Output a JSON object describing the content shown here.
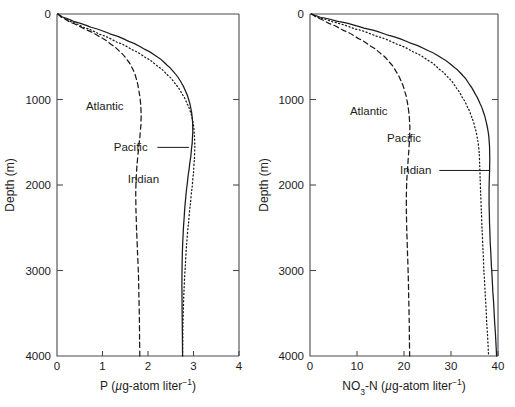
{
  "figure": {
    "background_color": "#ffffff",
    "curve_color": "#1a1a1a",
    "axis_color": "#4a4a52"
  },
  "chart_data": [
    {
      "type": "line",
      "panel": "left",
      "title": "",
      "xlabel": "P (µg-atom liter⁻¹)",
      "xlabel_parts": {
        "symbol": "P",
        "open": " (",
        "unit_italic": "µ",
        "unit_rest": "g-atom liter",
        "exponent": "−1",
        "close": ")"
      },
      "ylabel": "Depth (m)",
      "xlim": [
        0,
        4
      ],
      "ylim": [
        0,
        4000
      ],
      "y_inverted": true,
      "grid": false,
      "legend": "inline-annotations",
      "xticks": [
        0,
        1,
        2,
        3,
        4
      ],
      "xtick_labels": [
        "0",
        "1",
        "2",
        "3",
        "4"
      ],
      "yticks": [
        0,
        1000,
        2000,
        3000,
        4000
      ],
      "ytick_labels": [
        "0",
        "1000",
        "2000",
        "3000",
        "4000"
      ],
      "series": [
        {
          "name": "Atlantic",
          "style": "dashed",
          "x": [
            0.02,
            0.1,
            0.3,
            0.62,
            0.95,
            1.2,
            1.4,
            1.56,
            1.68,
            1.76,
            1.81,
            1.84,
            1.85,
            1.845,
            1.82,
            1.79,
            1.76,
            1.74,
            1.73,
            1.735,
            1.75,
            1.77,
            1.79,
            1.8,
            1.81,
            1.815,
            1.82
          ],
          "y": [
            0,
            40,
            100,
            180,
            270,
            360,
            450,
            550,
            660,
            790,
            930,
            1060,
            1180,
            1300,
            1450,
            1600,
            1760,
            1920,
            2100,
            2300,
            2550,
            2800,
            3050,
            3300,
            3550,
            3800,
            4000
          ]
        },
        {
          "name": "Pacific",
          "style": "solid",
          "x": [
            0.02,
            0.12,
            0.36,
            0.75,
            1.18,
            1.58,
            1.92,
            2.2,
            2.42,
            2.6,
            2.74,
            2.84,
            2.91,
            2.955,
            2.98,
            2.985,
            2.97,
            2.94,
            2.9,
            2.86,
            2.82,
            2.79,
            2.765,
            2.75,
            2.745,
            2.75,
            2.76
          ],
          "y": [
            0,
            35,
            85,
            155,
            235,
            320,
            410,
            500,
            600,
            700,
            810,
            920,
            1030,
            1140,
            1260,
            1380,
            1520,
            1670,
            1830,
            2000,
            2200,
            2420,
            2650,
            2900,
            3180,
            3500,
            4000
          ]
        },
        {
          "name": "Indian",
          "style": "dotted",
          "x": [
            0.02,
            0.1,
            0.28,
            0.58,
            0.95,
            1.32,
            1.66,
            1.96,
            2.22,
            2.44,
            2.62,
            2.76,
            2.87,
            2.95,
            3.0,
            3.02,
            3.03,
            3.02,
            3.0,
            2.97,
            2.93,
            2.89,
            2.85,
            2.82,
            2.79,
            2.77,
            2.76
          ],
          "y": [
            0,
            35,
            85,
            155,
            240,
            330,
            420,
            515,
            615,
            720,
            830,
            945,
            1060,
            1175,
            1300,
            1420,
            1560,
            1700,
            1860,
            2030,
            2230,
            2450,
            2690,
            2950,
            3250,
            3600,
            4000
          ]
        }
      ],
      "annotations": [
        {
          "text": "Atlantic",
          "x_data": 1.05,
          "y_data": 1080,
          "leader": false
        },
        {
          "text": "Pacific",
          "x_data": 1.62,
          "y_data": 1560,
          "leader": true,
          "leader_to_x": 2.9,
          "leader_to_y": 1560
        },
        {
          "text": "Indian",
          "x_data": 1.9,
          "y_data": 1930,
          "leader": false
        }
      ]
    },
    {
      "type": "line",
      "panel": "right",
      "title": "",
      "xlabel": "NO3-N (µg-atom liter⁻¹)",
      "xlabel_parts": {
        "symbol": "NO",
        "subscript": "3",
        "symbol_tail": "-N",
        "open": " (",
        "unit_italic": "µ",
        "unit_rest": "g-atom liter",
        "exponent": "−1",
        "close": ")"
      },
      "ylabel": "Depth (m)",
      "xlim": [
        0,
        40
      ],
      "ylim": [
        0,
        4000
      ],
      "y_inverted": true,
      "grid": false,
      "legend": "inline-annotations",
      "xticks": [
        0,
        10,
        20,
        30,
        40
      ],
      "xtick_labels": [
        "0",
        "10",
        "20",
        "30",
        "40"
      ],
      "yticks": [
        0,
        1000,
        2000,
        3000,
        4000
      ],
      "ytick_labels": [
        "0",
        "1000",
        "2000",
        "3000",
        "4000"
      ],
      "series": [
        {
          "name": "Atlantic",
          "style": "dashed",
          "x": [
            0.3,
            1.6,
            4.0,
            7.2,
            10.4,
            13.0,
            15.2,
            17.0,
            18.4,
            19.5,
            20.3,
            20.8,
            21.1,
            21.25,
            21.2,
            21.0,
            20.8,
            20.6,
            20.5,
            20.5,
            20.6,
            20.75,
            20.9,
            21.0,
            21.1,
            21.15,
            21.2
          ],
          "y": [
            0,
            45,
            110,
            195,
            290,
            380,
            470,
            570,
            680,
            800,
            930,
            1060,
            1190,
            1320,
            1470,
            1620,
            1780,
            1940,
            2120,
            2320,
            2560,
            2810,
            3060,
            3320,
            3570,
            3810,
            4000
          ]
        },
        {
          "name": "Pacific",
          "style": "dotted",
          "x": [
            0.3,
            1.8,
            5.0,
            9.6,
            14.4,
            18.6,
            22.2,
            25.2,
            27.6,
            29.6,
            31.2,
            32.5,
            33.6,
            34.5,
            35.2,
            35.7,
            36.0,
            36.1,
            36.2,
            36.3,
            36.45,
            36.6,
            36.8,
            37.0,
            37.3,
            37.6,
            38.0
          ],
          "y": [
            0,
            40,
            95,
            175,
            265,
            355,
            450,
            545,
            650,
            755,
            870,
            985,
            1100,
            1220,
            1350,
            1480,
            1620,
            1770,
            1930,
            2100,
            2300,
            2520,
            2760,
            3020,
            3300,
            3620,
            4000
          ]
        },
        {
          "name": "Indian",
          "style": "solid",
          "x": [
            0.3,
            2.2,
            6.2,
            11.5,
            16.8,
            21.4,
            25.2,
            28.2,
            30.6,
            32.5,
            34.0,
            35.2,
            36.2,
            37.0,
            37.6,
            38.0,
            38.2,
            38.25,
            38.2,
            38.1,
            38.1,
            38.2,
            38.35,
            38.6,
            38.9,
            39.3,
            39.7
          ],
          "y": [
            0,
            38,
            90,
            165,
            250,
            340,
            430,
            520,
            620,
            720,
            830,
            940,
            1050,
            1165,
            1290,
            1410,
            1550,
            1700,
            1860,
            2030,
            2230,
            2450,
            2690,
            2950,
            3250,
            3620,
            4000
          ]
        }
      ],
      "annotations": [
        {
          "text": "Atlantic",
          "x_data": 12.5,
          "y_data": 1140,
          "leader": false
        },
        {
          "text": "Pacific",
          "x_data": 20.0,
          "y_data": 1450,
          "leader": false
        },
        {
          "text": "Indian",
          "x_data": 22.5,
          "y_data": 1830,
          "leader": true,
          "leader_to_x": 38.2,
          "leader_to_y": 1830
        }
      ]
    }
  ]
}
